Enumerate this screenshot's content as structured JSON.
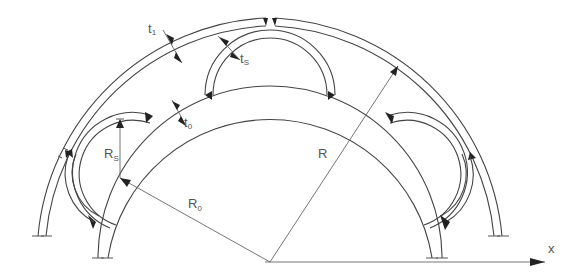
{
  "diagram": {
    "title": "",
    "labels": {
      "t1": {
        "main": "t",
        "sub": "1"
      },
      "ts": {
        "main": "t",
        "sub": "S"
      },
      "t0": {
        "main": "t",
        "sub": "0"
      },
      "Rs": {
        "main": "R",
        "sub": "S"
      },
      "R": {
        "main": "R",
        "sub": ""
      },
      "R0": {
        "main": "R",
        "sub": "0"
      },
      "x": {
        "main": "x",
        "sub": ""
      }
    },
    "colors": {
      "line": "#444444",
      "label": "#555555",
      "weld": "#222222",
      "background": "#ffffff"
    }
  }
}
